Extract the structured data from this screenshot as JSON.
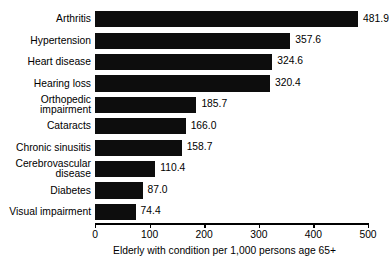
{
  "chart_data": {
    "type": "bar",
    "orientation": "horizontal",
    "title": "",
    "subtitle": "",
    "xlabel": "Elderly with condition per 1,000 persons age 65+",
    "ylabel": "",
    "xlim": [
      0,
      500
    ],
    "xticks": [
      0,
      100,
      200,
      300,
      400,
      500
    ],
    "xticklabels": [
      "0",
      "100",
      "200",
      "300",
      "400",
      "500"
    ],
    "grid": false,
    "legend": null,
    "bar_color": "#0d0d0d",
    "background_color": "#ffffff",
    "categories": [
      "Arthritis",
      "Hypertension",
      "Heart disease",
      "Hearing loss",
      "Orthopedic\nimpairment",
      "Cataracts",
      "Chronic sinusitis",
      "Cerebrovascular\ndisease",
      "Diabetes",
      "Visual impairment"
    ],
    "values": [
      481.9,
      357.6,
      324.6,
      320.4,
      185.7,
      166.0,
      158.7,
      110.4,
      87.0,
      74.4
    ],
    "value_labels": [
      "481.9",
      "357.6",
      "324.6",
      "320.4",
      "185.7",
      "166.0",
      "158.7",
      "110.4",
      "87.0",
      "74.4"
    ]
  }
}
